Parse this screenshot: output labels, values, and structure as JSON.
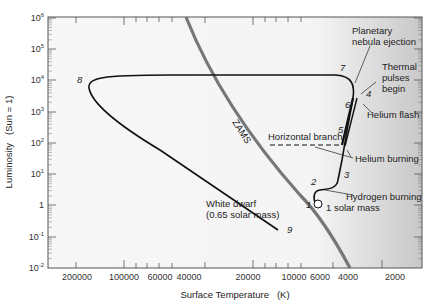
{
  "chart_data": {
    "type": "line",
    "title": "",
    "xlabel": "Surface Temperature (K)",
    "ylabel": "Luminosity (Sun = 1)",
    "x_scale": "log, reversed",
    "y_scale": "log",
    "xlim": [
      300000,
      1400
    ],
    "ylim": [
      0.01,
      1000000
    ],
    "x_ticks": [
      "200000",
      "100000",
      "60000",
      "40000",
      "20000",
      "10000",
      "6000",
      "4000",
      "2000"
    ],
    "y_ticks": [
      "10^6",
      "10^5",
      "10^4",
      "10^3",
      "10^2",
      "10^1",
      "1",
      "10^-1",
      "10^-2"
    ],
    "grid": false,
    "series": [
      {
        "name": "ZAMS",
        "style": "thick gray line",
        "points": [
          [
            29000,
            1000000
          ],
          [
            20000,
            20000
          ],
          [
            10000,
            200
          ],
          [
            6000,
            1
          ],
          [
            3500,
            0.01
          ]
        ]
      },
      {
        "name": "1 solar mass evolutionary track",
        "style": "black line",
        "points": [
          [
            5800,
            1
          ],
          [
            5200,
            5
          ],
          [
            4500,
            10
          ],
          [
            3900,
            200
          ],
          [
            3700,
            1000
          ],
          [
            3400,
            10000
          ],
          [
            30000,
            15000
          ],
          [
            70000,
            5000
          ],
          [
            10000,
            0.5
          ]
        ]
      },
      {
        "name": "Horizontal branch",
        "style": "dashed",
        "points": [
          [
            20000,
            80
          ],
          [
            5000,
            80
          ]
        ]
      }
    ],
    "stage_labels": [
      "1",
      "2",
      "3",
      "4",
      "5",
      "6",
      "7",
      "8",
      "9"
    ],
    "annotations": [
      "Planetary nebula ejection",
      "Thermal pulses begin",
      "Helium flash",
      "Horizontal branch",
      "Helium burning",
      "Hydrogen burning",
      "1 solar mass",
      "White dwarf (0.65 solar mass)",
      "ZAMS"
    ]
  },
  "axes": {
    "xlabel": "Surface Temperature",
    "xunit": "(K)",
    "ylabel": "Luminosity",
    "yunit": "(Sun = 1)",
    "x_ticks": [
      "200000",
      "100000",
      "60000",
      "40000",
      "20000",
      "10000",
      "6000",
      "4000",
      "2000"
    ],
    "y_ticks": [
      {
        "base": "10",
        "exp": "6"
      },
      {
        "base": "10",
        "exp": "5"
      },
      {
        "base": "10",
        "exp": "4"
      },
      {
        "base": "10",
        "exp": "3"
      },
      {
        "base": "10",
        "exp": "2"
      },
      {
        "base": "10",
        "exp": "1"
      },
      {
        "base": "1",
        "exp": ""
      },
      {
        "base": "10",
        "exp": "-1"
      },
      {
        "base": "10",
        "exp": "-2"
      }
    ]
  },
  "labels": {
    "zams": "ZAMS",
    "planetary_1": "Planetary",
    "planetary_2": "nebula ejection",
    "thermal_1": "Thermal",
    "thermal_2": "pulses",
    "thermal_3": "begin",
    "helium_flash": "Helium flash",
    "horizontal_branch": "Horizontal branch",
    "helium_burning": "Helium burning",
    "hydrogen_burning": "Hydrogen burning",
    "solar_mass": "1 solar mass",
    "white_dwarf_1": "White dwarf",
    "white_dwarf_2": "(0.65 solar mass)",
    "stages": [
      "1",
      "2",
      "3",
      "4",
      "5",
      "6",
      "7",
      "8",
      "9"
    ]
  }
}
